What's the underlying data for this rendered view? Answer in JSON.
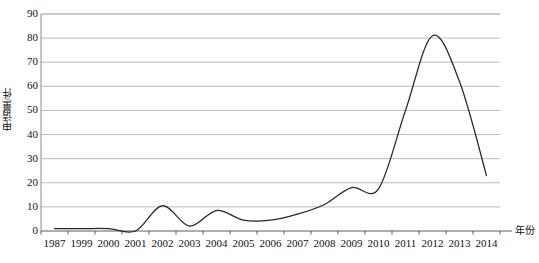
{
  "chart_data": {
    "type": "line",
    "title": "",
    "xlabel": "年份",
    "ylabel": "申请量/件",
    "categories": [
      "1987",
      "1999",
      "2000",
      "2001",
      "2002",
      "2003",
      "2004",
      "2005",
      "2006",
      "2007",
      "2008",
      "2009",
      "2010",
      "2011",
      "2012",
      "2013",
      "2014"
    ],
    "values": [
      1,
      1,
      1,
      0,
      10.5,
      2,
      8.5,
      4.5,
      4.5,
      7,
      11,
      18,
      17.5,
      50,
      81,
      62,
      23
    ],
    "series": [
      {
        "name": "申请量",
        "values": [
          1,
          1,
          1,
          0,
          10.5,
          2,
          8.5,
          4.5,
          4.5,
          7,
          11,
          18,
          17.5,
          50,
          81,
          62,
          23
        ]
      }
    ],
    "ylim": [
      0,
      90
    ],
    "y_ticks": [
      0,
      10,
      20,
      30,
      40,
      50,
      60,
      70,
      80,
      90
    ],
    "y_tick_labels": [
      "0",
      "10",
      "20",
      "30",
      "40",
      "50",
      "60",
      "70",
      "80",
      "90"
    ],
    "x_tick_labels": [
      "1987",
      "1999",
      "2000",
      "2001",
      "2002",
      "2003",
      "2004",
      "2005",
      "2006",
      "2007",
      "2008",
      "2009",
      "2010",
      "2011",
      "2012",
      "2013",
      "2014"
    ],
    "grid": "horizontal",
    "legend": "none",
    "line_color": "#262626",
    "grid_color": "#b3b3b3",
    "axis_color": "#808080",
    "background": "#ffffff",
    "smoothing": "spline"
  }
}
